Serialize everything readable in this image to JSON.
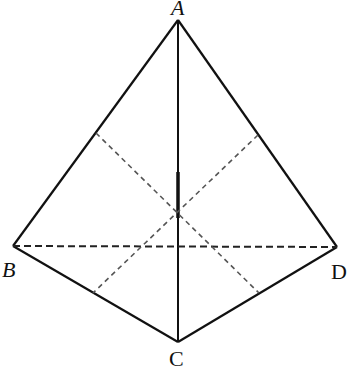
{
  "diagram": {
    "type": "geometry-figure",
    "points": {
      "A": {
        "label": "A",
        "x": 178,
        "y": 20
      },
      "B": {
        "label": "B",
        "x": 13,
        "y": 246
      },
      "C": {
        "label": "C",
        "x": 178,
        "y": 342
      },
      "D": {
        "label": "D",
        "x": 337,
        "y": 247
      }
    },
    "solid_edges": [
      "AB",
      "AD",
      "BC",
      "CD",
      "AC"
    ],
    "dashed_edges": [
      "BD"
    ],
    "dashed_midlines": [
      {
        "from": [
          96,
          133
        ],
        "to": [
          259,
          293
        ]
      },
      {
        "from": [
          258,
          135
        ],
        "to": [
          93,
          293
        ]
      }
    ],
    "colors": {
      "solid": "#111111",
      "dashed": "#555555"
    }
  }
}
